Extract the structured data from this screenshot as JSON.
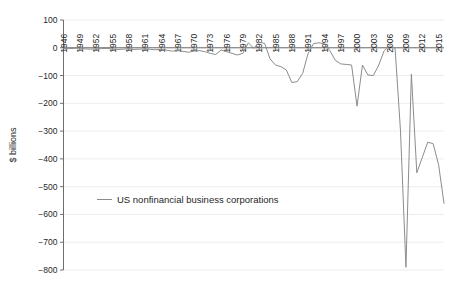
{
  "chart_data": {
    "type": "line",
    "title": "",
    "subtitle": "",
    "xlabel": "",
    "ylabel": "$ billions",
    "xlim": [
      1946,
      2016
    ],
    "ylim": [
      -800,
      100
    ],
    "grid": true,
    "grid_axis": "y",
    "legend_position": "inside-left",
    "line_color": "#8c8c8c",
    "axis_color": "#6e6e6e",
    "grid_color": "#e8e8e8",
    "text_color": "#1f1f1f",
    "background": "#ffffff",
    "xticks": [
      1946,
      1949,
      1952,
      1955,
      1958,
      1961,
      1964,
      1967,
      1970,
      1973,
      1976,
      1979,
      1982,
      1985,
      1988,
      1991,
      1994,
      1997,
      2000,
      2003,
      2006,
      2009,
      2012,
      2015
    ],
    "xtick_labels": [
      "1946",
      "1949",
      "1952",
      "1955",
      "1958",
      "1961",
      "1964",
      "1967",
      "1970",
      "1973",
      "1976",
      "1979",
      "1982",
      "1985",
      "1988",
      "1991",
      "1994",
      "1997",
      "2000",
      "2003",
      "2006",
      "2009",
      "2012",
      "2015"
    ],
    "xtick_rotation": 90,
    "yticks": [
      100,
      0,
      -100,
      -200,
      -300,
      -400,
      -500,
      -600,
      -700,
      -800
    ],
    "ytick_labels": [
      "100",
      "0",
      "−100",
      "−200",
      "−300",
      "−400",
      "−500",
      "−600",
      "−700",
      "−800"
    ],
    "series": [
      {
        "name": "US nonfinancial business corporations",
        "color": "#8c8c8c",
        "x": [
          1946,
          1947,
          1948,
          1949,
          1950,
          1951,
          1952,
          1953,
          1954,
          1955,
          1956,
          1957,
          1958,
          1959,
          1960,
          1961,
          1962,
          1963,
          1964,
          1965,
          1966,
          1967,
          1968,
          1969,
          1970,
          1971,
          1972,
          1973,
          1974,
          1975,
          1976,
          1977,
          1978,
          1979,
          1980,
          1981,
          1982,
          1983,
          1984,
          1985,
          1986,
          1987,
          1988,
          1989,
          1990,
          1991,
          1992,
          1993,
          1994,
          1995,
          1996,
          1997,
          1998,
          1999,
          2000,
          2001,
          2002,
          2003,
          2004,
          2005,
          2006,
          2007,
          2008,
          2009,
          2010,
          2011,
          2012,
          2013,
          2014,
          2015,
          2016
        ],
        "y": [
          -2,
          -3,
          -2,
          -1,
          -4,
          -5,
          -4,
          -3,
          -2,
          -5,
          -6,
          -5,
          -3,
          -6,
          -5,
          -4,
          -6,
          -7,
          -6,
          -9,
          -12,
          -10,
          -13,
          -16,
          -12,
          -10,
          -14,
          -20,
          -24,
          -8,
          -14,
          -20,
          -26,
          -20,
          18,
          -2,
          20,
          16,
          -40,
          -62,
          -68,
          -80,
          -125,
          -122,
          -92,
          -20,
          15,
          18,
          14,
          -10,
          -45,
          -58,
          -60,
          -62,
          -210,
          -62,
          -98,
          -100,
          -62,
          -10,
          8,
          -2,
          -300,
          -790,
          -95,
          -450,
          -395,
          -340,
          -345,
          -420,
          -560
        ]
      }
    ],
    "legend": [
      {
        "label": "US nonfinancial business corporations",
        "color": "#8c8c8c"
      }
    ]
  }
}
